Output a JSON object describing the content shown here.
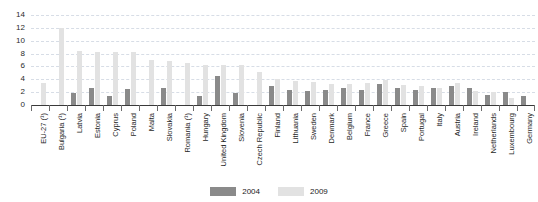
{
  "chart_data": {
    "type": "bar",
    "title": "",
    "subtitle": "",
    "xlabel": "",
    "ylabel": "",
    "ylim": [
      0,
      14
    ],
    "yticks": [
      0,
      2,
      4,
      6,
      8,
      10,
      12,
      14
    ],
    "grid": true,
    "legend_position": "bottom-center",
    "categories": [
      "EU-27 (¹)",
      "Bulgaria (¹)",
      "Latvia",
      "Estonia",
      "Cyprus",
      "Poland",
      "Malta",
      "Slovakia",
      "Romania (¹)",
      "Hungary",
      "United Kingdom",
      "Slovenia",
      "Czech Republic",
      "Finland",
      "Lithuania",
      "Sweden",
      "Denmark",
      "Belgium",
      "France",
      "Greece",
      "Spain",
      "Portugal",
      "Italy",
      "Austria",
      "Ireland",
      "Netherlands",
      "Luxembourg",
      "Germany"
    ],
    "series": [
      {
        "name": "2004",
        "color": "#8a8a8a",
        "values": [
          0,
          0,
          1.9,
          2.6,
          1.4,
          2.5,
          0,
          2.6,
          0,
          1.4,
          4.5,
          1.8,
          0,
          2.9,
          2.4,
          2.2,
          2.3,
          2.6,
          2.4,
          3.2,
          2.6,
          2.4,
          2.6,
          3.0,
          2.7,
          1.6,
          2.0,
          1.4
        ]
      },
      {
        "name": "2009",
        "color": "#e2e2e2",
        "values": [
          3.5,
          12.0,
          8.4,
          8.3,
          8.2,
          8.2,
          7.0,
          6.8,
          6.5,
          6.3,
          6.3,
          6.2,
          5.2,
          4.0,
          3.8,
          3.6,
          3.3,
          3.2,
          3.4,
          3.9,
          3.1,
          2.9,
          2.7,
          3.4,
          2.2,
          2.0,
          1.1,
          0
        ]
      }
    ]
  },
  "legend": {
    "items": [
      {
        "label": "2004"
      },
      {
        "label": "2009"
      }
    ]
  }
}
